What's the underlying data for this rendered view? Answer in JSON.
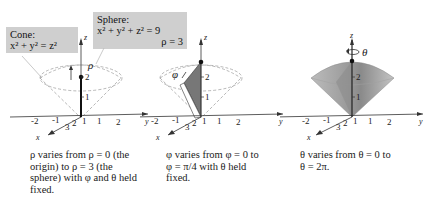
{
  "callouts": {
    "cone": {
      "title": "Cone:",
      "equation": "x² + y² = z²"
    },
    "sphere": {
      "title": "Sphere:",
      "equation": "x² + y² + z² = 9",
      "radius": "ρ = 3"
    }
  },
  "panels": [
    {
      "id": "rho",
      "symbol": "ρ",
      "caption": "ρ varies from ρ = 0 (the origin) to ρ = 3 (the sphere) with φ and θ held fixed.",
      "caption_lines": [
        "ρ varies from ρ = 0 (the",
        "origin) to ρ = 3 (the",
        "sphere) with φ and θ held",
        "fixed."
      ]
    },
    {
      "id": "phi",
      "symbol": "φ",
      "caption": "φ varies from φ = 0 to φ = π/4 with θ held fixed.",
      "caption_lines": [
        "φ varies from φ = 0 to",
        "φ = π/4 with θ held",
        "fixed."
      ]
    },
    {
      "id": "theta",
      "symbol": "θ",
      "caption": "θ varies from θ = 0 to θ = 2π.",
      "caption_lines": [
        "θ varies from θ = 0 to",
        "θ = 2π."
      ]
    }
  ],
  "axes": {
    "z_label": "z",
    "y_label": "y",
    "x_label": "x",
    "z_ticks": [
      "1",
      "2"
    ],
    "y_ticks": [
      "-2",
      "-1",
      "1",
      "2"
    ],
    "x_ticks": [
      "3",
      "2",
      "1"
    ]
  }
}
